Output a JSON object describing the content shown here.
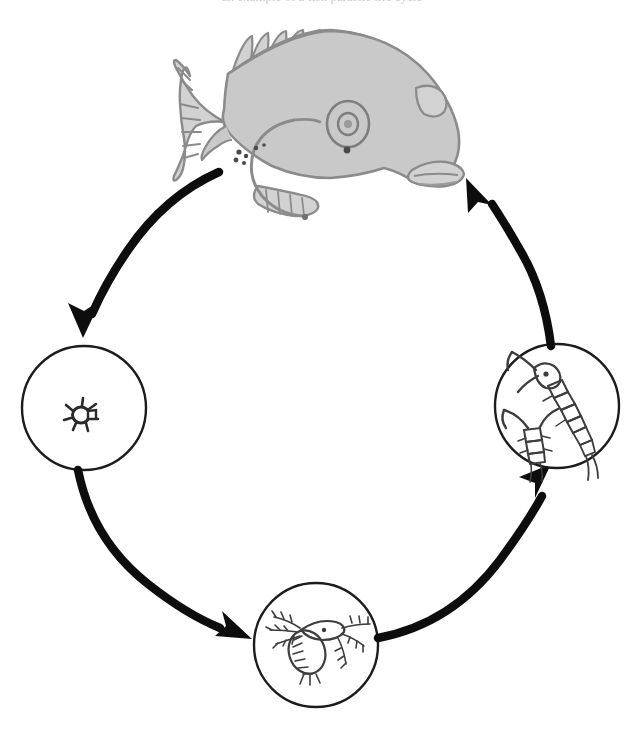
{
  "page": {
    "title": "Parasite / plankton life cycle diagram",
    "background_color": "#ffffff",
    "width": 644,
    "height": 740,
    "caption_partial": "an example of a fish parasite life cycle"
  },
  "colors": {
    "ink": "#1a1a1a",
    "arrow": "#111111",
    "fish_fill": "#c9c9c9",
    "fish_outline": "#8b8b8b",
    "circle_outline": "#1c1c1c",
    "organism_ink": "#3c3c3c",
    "page_background": "#ffffff"
  },
  "diagram": {
    "type": "life-cycle",
    "direction": "counterclockwise",
    "stage_count": 4,
    "arrow_count": 4,
    "nodes": [
      {
        "id": "fish",
        "label": "Fish",
        "icon": "fish-icon",
        "shape": "illustration",
        "filled": true,
        "center": {
          "x": 320,
          "y": 130
        },
        "radius": 0
      },
      {
        "id": "egg",
        "label": "Egg",
        "icon": "egg-icon",
        "shape": "circle",
        "filled": false,
        "center": {
          "x": 84,
          "y": 408
        },
        "radius": 62
      },
      {
        "id": "nauplius",
        "label": "Nauplius larva",
        "icon": "nauplius-larva-icon",
        "shape": "circle",
        "filled": false,
        "center": {
          "x": 316,
          "y": 645
        },
        "radius": 62
      },
      {
        "id": "copepod",
        "label": "Adult copepod",
        "icon": "copepod-icon",
        "shape": "circle",
        "filled": false,
        "center": {
          "x": 557,
          "y": 406
        },
        "radius": 62
      }
    ],
    "arrows": [
      {
        "id": "arrow-fish-to-egg",
        "from": "fish",
        "to": "egg",
        "label": ""
      },
      {
        "id": "arrow-egg-to-nauplius",
        "from": "egg",
        "to": "nauplius",
        "label": ""
      },
      {
        "id": "arrow-nauplius-to-copepod",
        "from": "nauplius",
        "to": "copepod",
        "label": ""
      },
      {
        "id": "arrow-copepod-to-fish",
        "from": "copepod",
        "to": "fish",
        "label": ""
      }
    ]
  }
}
